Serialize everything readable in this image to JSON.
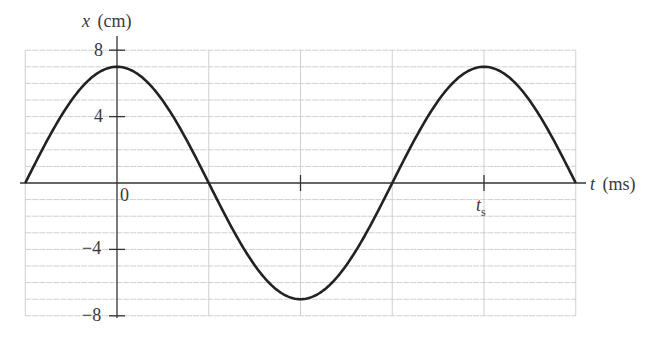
{
  "chart_data": {
    "type": "line",
    "title": "",
    "xlabel_var": "t",
    "xlabel_unit": "(ms)",
    "ylabel_var": "x",
    "ylabel_unit": "(cm)",
    "ylim": [
      -8,
      8
    ],
    "yticks": [
      8,
      4,
      -4,
      -8
    ],
    "y_tick_labels": [
      "8",
      "4",
      "−4",
      "−8"
    ],
    "x_tick_labels": [
      {
        "label": "0",
        "position": 0
      },
      {
        "label": "t",
        "sub": "s",
        "position": 4
      }
    ],
    "grid": true,
    "grid_minor_y_step": 1,
    "x_grid_positions": [
      -1,
      0,
      1,
      2,
      3,
      4,
      5
    ],
    "amplitude_cm": 7,
    "series": [
      {
        "name": "x(t)",
        "description": "cosine wave, amplitude ~7 cm, peak at t=0, period spans 4 grid divisions (t_s)",
        "x": [
          -1,
          0,
          1,
          2,
          3,
          4,
          5
        ],
        "values": [
          0,
          7,
          0,
          -7,
          0,
          7,
          0
        ]
      }
    ],
    "colors": {
      "curve": "#222222",
      "axis": "#333333",
      "grid": "#cfcfcf"
    }
  }
}
